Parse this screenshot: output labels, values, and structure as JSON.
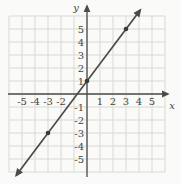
{
  "figure": {
    "background": "#fafaf8",
    "grid_color": "#d8dad3",
    "axis_color": "#4b4b48",
    "line_color": "#4a4a47",
    "point_color": "#3b3b39",
    "label_color": "#45453f"
  },
  "chart_data": {
    "type": "line",
    "title": "",
    "xlabel": "x",
    "ylabel": "y",
    "xlim": [
      -6,
      6
    ],
    "ylim": [
      -6,
      6
    ],
    "grid": true,
    "legend": "none",
    "x_tick_labels": [
      "-5",
      "-4",
      "-3",
      "-2",
      "1",
      "2",
      "3",
      "4",
      "5"
    ],
    "y_tick_labels": [
      "5",
      "4",
      "3",
      "2",
      "1",
      "-1",
      "-2",
      "-3",
      "-4",
      "-5"
    ],
    "series": [
      {
        "name": "line through (-3,-3), (0,1), (3,5)",
        "equation": "y = (4/3)x + 1",
        "slope_num": 4,
        "slope_den": 3,
        "intercept": 1,
        "marked_points": [
          [
            -3,
            -3
          ],
          [
            0,
            1
          ],
          [
            3,
            5
          ]
        ],
        "x_draw_range": [
          -5.45,
          4.1
        ],
        "arrow_ends": "both"
      }
    ]
  }
}
